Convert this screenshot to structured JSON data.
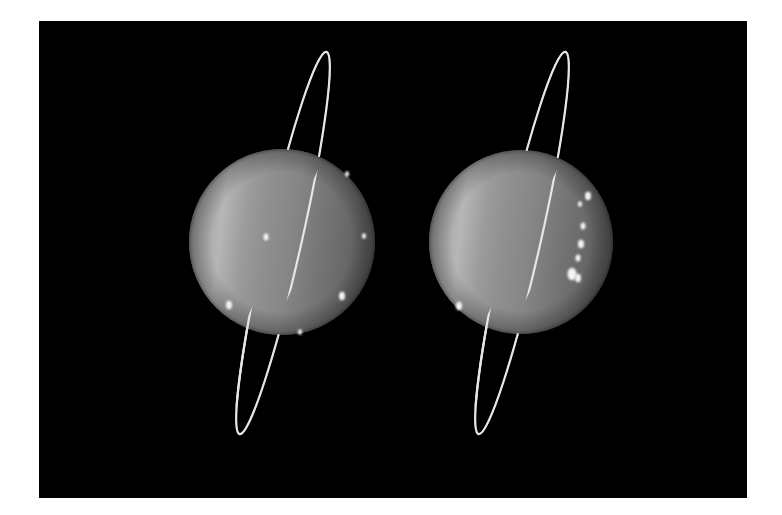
{
  "image": {
    "subject": "Uranus with ring system, two views side by side",
    "background_color": "#000000",
    "page_color": "#ffffff"
  },
  "frame": {
    "x": 39,
    "y": 21,
    "width": 708,
    "height": 477
  },
  "panels": [
    {
      "label": "Uranus view 1",
      "planet": {
        "cx": 282,
        "cy": 242,
        "r": 93
      },
      "ring": {
        "cx": 283,
        "cy": 243,
        "rx": 18,
        "ry": 196,
        "rotate_deg": 12.8
      },
      "bright_spots": [
        {
          "cx": 266,
          "cy": 237,
          "r": 2.5
        },
        {
          "cx": 342,
          "cy": 296,
          "r": 3
        },
        {
          "cx": 347,
          "cy": 174,
          "r": 2
        },
        {
          "cx": 364,
          "cy": 236,
          "r": 2
        },
        {
          "cx": 300,
          "cy": 332,
          "r": 2
        },
        {
          "cx": 229,
          "cy": 305,
          "r": 3
        }
      ]
    },
    {
      "label": "Uranus view 2",
      "planet": {
        "cx": 521,
        "cy": 242,
        "r": 92
      },
      "ring": {
        "cx": 522,
        "cy": 243,
        "rx": 18,
        "ry": 196,
        "rotate_deg": 12.8
      },
      "bright_spots": [
        {
          "cx": 588,
          "cy": 196,
          "r": 3
        },
        {
          "cx": 580,
          "cy": 204,
          "r": 2
        },
        {
          "cx": 583,
          "cy": 226,
          "r": 2.5
        },
        {
          "cx": 581,
          "cy": 244,
          "r": 3
        },
        {
          "cx": 578,
          "cy": 258,
          "r": 2.5
        },
        {
          "cx": 572,
          "cy": 274,
          "r": 4.5
        },
        {
          "cx": 578,
          "cy": 278,
          "r": 3
        },
        {
          "cx": 459,
          "cy": 306,
          "r": 3
        }
      ]
    }
  ],
  "colors": {
    "planet_light": "#b4b4b4",
    "planet_mid": "#8e8e8e",
    "planet_dark": "#5e5e5e",
    "ring": "#e6e6e6",
    "spot": "#f4f4f4"
  }
}
